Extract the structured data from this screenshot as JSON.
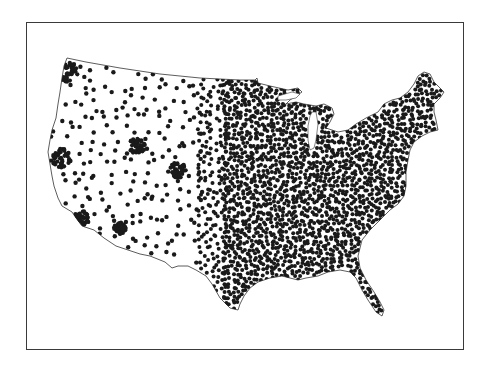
{
  "figure": {
    "type": "dot-density map",
    "region": "Contiguous United States",
    "title": "",
    "background_color": "#ffffff",
    "frame_color": "#3a3a3a",
    "dot_color": "#1a1a1a",
    "outline_color": "#333333"
  },
  "map": {
    "outline": [
      [
        67,
        58
      ],
      [
        86,
        62
      ],
      [
        120,
        68
      ],
      [
        160,
        74
      ],
      [
        200,
        78
      ],
      [
        240,
        80
      ],
      [
        255,
        80
      ],
      [
        257,
        78
      ],
      [
        258,
        83
      ],
      [
        270,
        86
      ],
      [
        288,
        90
      ],
      [
        298,
        88
      ],
      [
        302,
        92
      ],
      [
        290,
        100
      ],
      [
        286,
        104
      ],
      [
        296,
        102
      ],
      [
        304,
        104
      ],
      [
        316,
        106
      ],
      [
        324,
        104
      ],
      [
        332,
        108
      ],
      [
        334,
        114
      ],
      [
        330,
        122
      ],
      [
        326,
        128
      ],
      [
        338,
        132
      ],
      [
        348,
        130
      ],
      [
        356,
        124
      ],
      [
        366,
        118
      ],
      [
        378,
        112
      ],
      [
        384,
        104
      ],
      [
        392,
        100
      ],
      [
        400,
        98
      ],
      [
        408,
        92
      ],
      [
        414,
        84
      ],
      [
        418,
        76
      ],
      [
        424,
        72
      ],
      [
        430,
        74
      ],
      [
        434,
        82
      ],
      [
        440,
        88
      ],
      [
        444,
        92
      ],
      [
        440,
        98
      ],
      [
        434,
        104
      ],
      [
        434,
        112
      ],
      [
        436,
        120
      ],
      [
        438,
        130
      ],
      [
        430,
        132
      ],
      [
        422,
        136
      ],
      [
        414,
        142
      ],
      [
        410,
        150
      ],
      [
        408,
        160
      ],
      [
        406,
        172
      ],
      [
        406,
        186
      ],
      [
        404,
        196
      ],
      [
        398,
        204
      ],
      [
        390,
        210
      ],
      [
        380,
        220
      ],
      [
        370,
        230
      ],
      [
        362,
        240
      ],
      [
        358,
        256
      ],
      [
        360,
        268
      ],
      [
        366,
        280
      ],
      [
        374,
        292
      ],
      [
        380,
        302
      ],
      [
        384,
        310
      ],
      [
        382,
        316
      ],
      [
        376,
        312
      ],
      [
        368,
        300
      ],
      [
        362,
        290
      ],
      [
        356,
        278
      ],
      [
        350,
        272
      ],
      [
        340,
        270
      ],
      [
        328,
        272
      ],
      [
        318,
        276
      ],
      [
        306,
        278
      ],
      [
        298,
        280
      ],
      [
        290,
        278
      ],
      [
        282,
        276
      ],
      [
        270,
        278
      ],
      [
        258,
        282
      ],
      [
        250,
        288
      ],
      [
        244,
        296
      ],
      [
        240,
        304
      ],
      [
        238,
        310
      ],
      [
        230,
        308
      ],
      [
        220,
        298
      ],
      [
        212,
        284
      ],
      [
        206,
        276
      ],
      [
        196,
        270
      ],
      [
        188,
        266
      ],
      [
        178,
        266
      ],
      [
        172,
        268
      ],
      [
        165,
        262
      ],
      [
        150,
        256
      ],
      [
        140,
        254
      ],
      [
        128,
        250
      ],
      [
        116,
        246
      ],
      [
        104,
        238
      ],
      [
        94,
        230
      ],
      [
        82,
        226
      ],
      [
        76,
        218
      ],
      [
        72,
        212
      ],
      [
        62,
        206
      ],
      [
        58,
        198
      ],
      [
        54,
        186
      ],
      [
        52,
        176
      ],
      [
        50,
        164
      ],
      [
        48,
        152
      ],
      [
        50,
        140
      ],
      [
        52,
        130
      ],
      [
        56,
        118
      ],
      [
        58,
        104
      ],
      [
        60,
        92
      ],
      [
        62,
        78
      ],
      [
        64,
        66
      ],
      [
        67,
        58
      ]
    ],
    "lakes": [
      {
        "name": "Lake Michigan",
        "points": [
          [
            312,
            112
          ],
          [
            316,
            112
          ],
          [
            318,
            124
          ],
          [
            316,
            140
          ],
          [
            314,
            148
          ],
          [
            310,
            150
          ],
          [
            308,
            140
          ],
          [
            308,
            126
          ],
          [
            310,
            116
          ]
        ]
      },
      {
        "name": "Lake Superior",
        "points": [
          [
            278,
            96
          ],
          [
            292,
            92
          ],
          [
            300,
            94
          ],
          [
            296,
            98
          ],
          [
            286,
            100
          ],
          [
            278,
            100
          ]
        ]
      }
    ],
    "density_bands": [
      {
        "x_from": 40,
        "x_to": 200,
        "spacing": 10.5,
        "dot_radius": 2.2,
        "label": "sparse west"
      },
      {
        "x_from": 200,
        "x_to": 225,
        "spacing": 6.0,
        "dot_radius": 2.0,
        "label": "plains transition"
      },
      {
        "x_from": 225,
        "x_to": 450,
        "spacing": 4.2,
        "dot_radius": 2.0,
        "label": "dense east"
      }
    ],
    "clusters": [
      {
        "name": "Puget Sound",
        "x": 68,
        "y": 72,
        "r": 10
      },
      {
        "name": "Bay Area",
        "x": 60,
        "y": 158,
        "r": 10
      },
      {
        "name": "Denver",
        "x": 178,
        "y": 170,
        "r": 8
      },
      {
        "name": "Salt Lake",
        "x": 137,
        "y": 146,
        "r": 8
      },
      {
        "name": "Los Angeles",
        "x": 80,
        "y": 218,
        "r": 8
      },
      {
        "name": "Phoenix",
        "x": 120,
        "y": 228,
        "r": 6
      }
    ]
  }
}
